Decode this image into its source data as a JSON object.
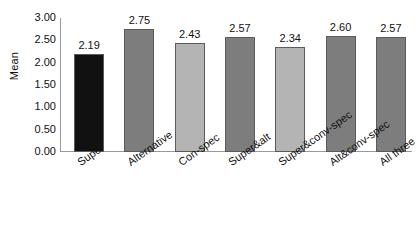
{
  "chart_data": {
    "type": "bar",
    "title": "",
    "xlabel": "",
    "ylabel": "Mean",
    "ylim": [
      0,
      3.0
    ],
    "ytick_step": 0.5,
    "grid": false,
    "legend": "none",
    "categories": [
      "Super",
      "Alternative",
      "Con-spec",
      "Super&alt",
      "Super&conv-spec",
      "Alt&conv-spec",
      "All three"
    ],
    "values": [
      2.19,
      2.75,
      2.43,
      2.57,
      2.34,
      2.6,
      2.57
    ],
    "value_labels": [
      "2.19",
      "2.75",
      "2.43",
      "2.57",
      "2.34",
      "2.60",
      "2.57"
    ],
    "ytick_labels": [
      "3.00",
      "2.50",
      "2.00",
      "1.50",
      "1.00",
      "0.50",
      "0.00"
    ],
    "ytick_values": [
      3.0,
      2.5,
      2.0,
      1.5,
      1.0,
      0.5,
      0.0
    ],
    "bar_colors": [
      "#111111",
      "#7d7d7d",
      "#b4b4b4",
      "#7d7d7d",
      "#b4b4b4",
      "#7d7d7d",
      "#7d7d7d"
    ],
    "bar_edge_color": "#5b5b5b",
    "axis_color": "#9a9a9a",
    "background_color": "#ffffff",
    "text_color": "#111111"
  }
}
